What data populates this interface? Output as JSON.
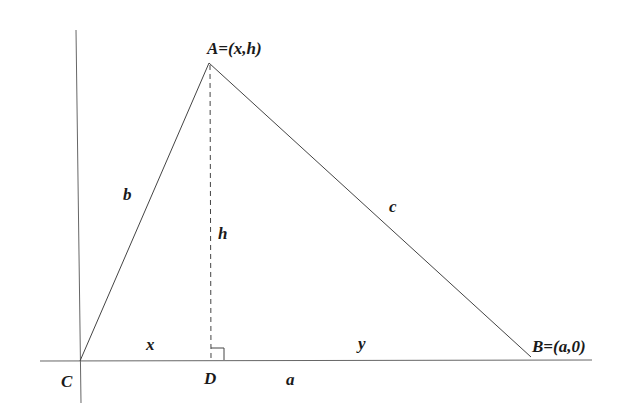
{
  "diagram": {
    "colors": {
      "background": "#ffffff",
      "line": "#555555",
      "text": "#1a1a1a"
    },
    "axes": {
      "horizontal": {
        "x1": 40,
        "y1": 361,
        "x2": 592,
        "y2": 360
      },
      "vertical": {
        "x1": 76,
        "y1": 30,
        "x2": 81,
        "y2": 403
      }
    },
    "points": {
      "A": {
        "x": 209,
        "y": 63,
        "label": "A=(x,h)"
      },
      "B": {
        "x": 531,
        "y": 357,
        "label": "B=(a,0)"
      },
      "C": {
        "x": 80,
        "y": 361,
        "label": "C"
      },
      "D": {
        "x": 211,
        "y": 360,
        "label": "D"
      }
    },
    "sides": {
      "b": "b",
      "c": "c",
      "a": "a",
      "h": "h",
      "x": "x",
      "y": "y"
    },
    "right_angle_marker": {
      "x": 211,
      "y": 348,
      "size": 13
    }
  }
}
